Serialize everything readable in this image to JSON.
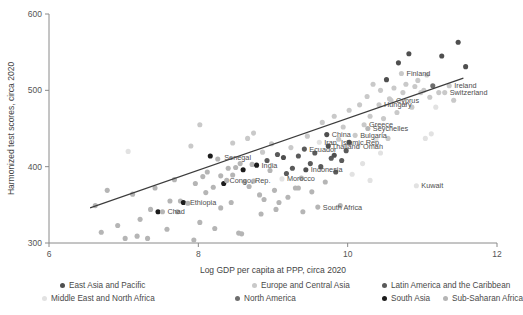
{
  "chart_data": {
    "type": "scatter",
    "title": "",
    "xlabel": "Log GDP per capita at PPP, circa 2020",
    "ylabel": "Harmonized test scores, circa 2020",
    "xlim": [
      6,
      12
    ],
    "ylim": [
      300,
      600
    ],
    "xticks": [
      6,
      8,
      10,
      12
    ],
    "yticks": [
      300,
      400,
      500,
      600
    ],
    "grid": false,
    "legend_position": "bottom",
    "trendline": {
      "x0": 6.55,
      "y0": 346,
      "x1": 11.55,
      "y1": 516,
      "color": "#3c3c3c"
    },
    "legend": [
      {
        "name": "East Asia and Pacific",
        "color": "#4f4f4f"
      },
      {
        "name": "Europe and Central Asia",
        "color": "#c9c9c9"
      },
      {
        "name": "Latin America and the Caribbean",
        "color": "#5a5a5a"
      },
      {
        "name": "Middle East and North Africa",
        "color": "#e2e2e2"
      },
      {
        "name": "North America",
        "color": "#6e6e6e"
      },
      {
        "name": "South Asia",
        "color": "#1c1c1c"
      },
      {
        "name": "Sub-Saharan Africa",
        "color": "#b5b5b5"
      }
    ],
    "annotations": [
      {
        "label": "Finland",
        "x": 10.72,
        "y": 522
      },
      {
        "label": "Ireland",
        "x": 11.36,
        "y": 506
      },
      {
        "label": "Switzerland",
        "x": 11.3,
        "y": 497
      },
      {
        "label": "Cyprus",
        "x": 10.58,
        "y": 487
      },
      {
        "label": "Hungary",
        "x": 10.42,
        "y": 481
      },
      {
        "label": "Greece",
        "x": 10.22,
        "y": 455
      },
      {
        "label": "Seychelles",
        "x": 10.27,
        "y": 450
      },
      {
        "label": "Bulgaria",
        "x": 10.1,
        "y": 441
      },
      {
        "label": "China",
        "x": 9.72,
        "y": 442
      },
      {
        "label": "Iran, Islamic Rep.",
        "x": 9.62,
        "y": 432
      },
      {
        "label": "Thailand",
        "x": 9.72,
        "y": 427
      },
      {
        "label": "Oman",
        "x": 10.14,
        "y": 427
      },
      {
        "label": "Ecuador",
        "x": 9.42,
        "y": 423
      },
      {
        "label": "Senegal",
        "x": 8.28,
        "y": 412
      },
      {
        "label": "India",
        "x": 8.78,
        "y": 402
      },
      {
        "label": "Indonesia",
        "x": 9.44,
        "y": 396
      },
      {
        "label": "Morocco",
        "x": 9.12,
        "y": 384
      },
      {
        "label": "Congo, Rep.",
        "x": 8.35,
        "y": 382
      },
      {
        "label": "Ethiopia",
        "x": 7.82,
        "y": 353
      },
      {
        "label": "Chad",
        "x": 7.52,
        "y": 341
      },
      {
        "label": "South Africa",
        "x": 9.6,
        "y": 347
      },
      {
        "label": "Kuwait",
        "x": 10.92,
        "y": 375
      }
    ],
    "points": [
      {
        "x": 6.62,
        "y": 349,
        "g": 6
      },
      {
        "x": 6.7,
        "y": 314,
        "g": 6
      },
      {
        "x": 6.78,
        "y": 369,
        "g": 6
      },
      {
        "x": 6.92,
        "y": 323,
        "g": 6
      },
      {
        "x": 7.02,
        "y": 306,
        "g": 6
      },
      {
        "x": 7.06,
        "y": 420,
        "g": 3
      },
      {
        "x": 7.12,
        "y": 364,
        "g": 6
      },
      {
        "x": 7.18,
        "y": 309,
        "g": 6
      },
      {
        "x": 7.22,
        "y": 331,
        "g": 6
      },
      {
        "x": 7.32,
        "y": 306,
        "g": 6
      },
      {
        "x": 7.36,
        "y": 344,
        "g": 6
      },
      {
        "x": 7.42,
        "y": 372,
        "g": 6
      },
      {
        "x": 7.46,
        "y": 341,
        "g": 5
      },
      {
        "x": 7.52,
        "y": 341,
        "g": 6
      },
      {
        "x": 7.58,
        "y": 318,
        "g": 6
      },
      {
        "x": 7.62,
        "y": 355,
        "g": 6
      },
      {
        "x": 7.68,
        "y": 383,
        "g": 6
      },
      {
        "x": 7.72,
        "y": 341,
        "g": 6
      },
      {
        "x": 7.76,
        "y": 355,
        "g": 6
      },
      {
        "x": 7.8,
        "y": 353,
        "g": 5
      },
      {
        "x": 7.86,
        "y": 352,
        "g": 6
      },
      {
        "x": 7.9,
        "y": 427,
        "g": 1
      },
      {
        "x": 7.94,
        "y": 304,
        "g": 6
      },
      {
        "x": 7.96,
        "y": 378,
        "g": 6
      },
      {
        "x": 8.02,
        "y": 455,
        "g": 1
      },
      {
        "x": 8.06,
        "y": 387,
        "g": 6
      },
      {
        "x": 8.1,
        "y": 366,
        "g": 6
      },
      {
        "x": 8.12,
        "y": 393,
        "g": 6
      },
      {
        "x": 8.16,
        "y": 414,
        "g": 5
      },
      {
        "x": 8.2,
        "y": 373,
        "g": 6
      },
      {
        "x": 8.22,
        "y": 319,
        "g": 6
      },
      {
        "x": 8.26,
        "y": 410,
        "g": 6
      },
      {
        "x": 8.3,
        "y": 388,
        "g": 6
      },
      {
        "x": 8.34,
        "y": 378,
        "g": 5
      },
      {
        "x": 8.38,
        "y": 382,
        "g": 6
      },
      {
        "x": 8.4,
        "y": 398,
        "g": 6
      },
      {
        "x": 8.44,
        "y": 353,
        "g": 6
      },
      {
        "x": 8.46,
        "y": 389,
        "g": 6
      },
      {
        "x": 8.5,
        "y": 399,
        "g": 6
      },
      {
        "x": 8.54,
        "y": 313,
        "g": 6
      },
      {
        "x": 8.56,
        "y": 404,
        "g": 6
      },
      {
        "x": 8.58,
        "y": 312,
        "g": 6
      },
      {
        "x": 8.6,
        "y": 396,
        "g": 5
      },
      {
        "x": 8.62,
        "y": 380,
        "g": 6
      },
      {
        "x": 8.66,
        "y": 437,
        "g": 1
      },
      {
        "x": 8.68,
        "y": 374,
        "g": 6
      },
      {
        "x": 8.72,
        "y": 403,
        "g": 6
      },
      {
        "x": 8.74,
        "y": 381,
        "g": 6
      },
      {
        "x": 8.78,
        "y": 402,
        "g": 5
      },
      {
        "x": 8.82,
        "y": 363,
        "g": 6
      },
      {
        "x": 8.86,
        "y": 419,
        "g": 1
      },
      {
        "x": 8.88,
        "y": 357,
        "g": 6
      },
      {
        "x": 8.92,
        "y": 408,
        "g": 2
      },
      {
        "x": 8.96,
        "y": 395,
        "g": 6
      },
      {
        "x": 8.98,
        "y": 430,
        "g": 1
      },
      {
        "x": 9.02,
        "y": 369,
        "g": 6
      },
      {
        "x": 9.06,
        "y": 416,
        "g": 2
      },
      {
        "x": 9.08,
        "y": 353,
        "g": 6
      },
      {
        "x": 9.12,
        "y": 384,
        "g": 3
      },
      {
        "x": 9.14,
        "y": 412,
        "g": 0
      },
      {
        "x": 9.18,
        "y": 391,
        "g": 2
      },
      {
        "x": 9.2,
        "y": 360,
        "g": 6
      },
      {
        "x": 9.24,
        "y": 425,
        "g": 1
      },
      {
        "x": 9.26,
        "y": 398,
        "g": 2
      },
      {
        "x": 9.3,
        "y": 372,
        "g": 6
      },
      {
        "x": 9.34,
        "y": 414,
        "g": 2
      },
      {
        "x": 9.38,
        "y": 385,
        "g": 6
      },
      {
        "x": 9.42,
        "y": 423,
        "g": 2
      },
      {
        "x": 9.44,
        "y": 396,
        "g": 0
      },
      {
        "x": 9.46,
        "y": 440,
        "g": 1
      },
      {
        "x": 9.5,
        "y": 404,
        "g": 2
      },
      {
        "x": 9.52,
        "y": 367,
        "g": 6
      },
      {
        "x": 9.56,
        "y": 418,
        "g": 2
      },
      {
        "x": 9.6,
        "y": 347,
        "g": 6
      },
      {
        "x": 9.62,
        "y": 432,
        "g": 3
      },
      {
        "x": 9.64,
        "y": 400,
        "g": 2
      },
      {
        "x": 9.66,
        "y": 458,
        "g": 1
      },
      {
        "x": 9.7,
        "y": 380,
        "g": 6
      },
      {
        "x": 9.72,
        "y": 442,
        "g": 0
      },
      {
        "x": 9.74,
        "y": 427,
        "g": 0
      },
      {
        "x": 9.78,
        "y": 411,
        "g": 2
      },
      {
        "x": 9.82,
        "y": 466,
        "g": 1
      },
      {
        "x": 9.84,
        "y": 393,
        "g": 2
      },
      {
        "x": 9.88,
        "y": 436,
        "g": 1
      },
      {
        "x": 9.92,
        "y": 408,
        "g": 2
      },
      {
        "x": 9.94,
        "y": 452,
        "g": 1
      },
      {
        "x": 9.98,
        "y": 421,
        "g": 2
      },
      {
        "x": 10.02,
        "y": 474,
        "g": 1
      },
      {
        "x": 10.06,
        "y": 390,
        "g": 3
      },
      {
        "x": 10.1,
        "y": 441,
        "g": 1
      },
      {
        "x": 10.14,
        "y": 427,
        "g": 3
      },
      {
        "x": 10.16,
        "y": 481,
        "g": 1
      },
      {
        "x": 10.2,
        "y": 404,
        "g": 3
      },
      {
        "x": 10.22,
        "y": 455,
        "g": 1
      },
      {
        "x": 10.26,
        "y": 492,
        "g": 1
      },
      {
        "x": 10.27,
        "y": 450,
        "g": 6
      },
      {
        "x": 10.3,
        "y": 466,
        "g": 1
      },
      {
        "x": 10.34,
        "y": 508,
        "g": 1
      },
      {
        "x": 10.38,
        "y": 436,
        "g": 3
      },
      {
        "x": 10.42,
        "y": 481,
        "g": 1
      },
      {
        "x": 10.44,
        "y": 500,
        "g": 1
      },
      {
        "x": 10.48,
        "y": 463,
        "g": 1
      },
      {
        "x": 10.52,
        "y": 514,
        "g": 0
      },
      {
        "x": 10.56,
        "y": 489,
        "g": 1
      },
      {
        "x": 10.58,
        "y": 487,
        "g": 1
      },
      {
        "x": 10.62,
        "y": 503,
        "g": 1
      },
      {
        "x": 10.66,
        "y": 471,
        "g": 1
      },
      {
        "x": 10.68,
        "y": 536,
        "g": 0
      },
      {
        "x": 10.72,
        "y": 522,
        "g": 1
      },
      {
        "x": 10.74,
        "y": 497,
        "g": 1
      },
      {
        "x": 10.78,
        "y": 508,
        "g": 1
      },
      {
        "x": 10.82,
        "y": 548,
        "g": 0
      },
      {
        "x": 10.86,
        "y": 478,
        "g": 1
      },
      {
        "x": 10.9,
        "y": 505,
        "g": 1
      },
      {
        "x": 10.92,
        "y": 375,
        "g": 3
      },
      {
        "x": 10.94,
        "y": 513,
        "g": 1
      },
      {
        "x": 10.98,
        "y": 497,
        "g": 1
      },
      {
        "x": 11.02,
        "y": 500,
        "g": 1
      },
      {
        "x": 11.04,
        "y": 437,
        "g": 3
      },
      {
        "x": 11.06,
        "y": 520,
        "g": 1
      },
      {
        "x": 11.1,
        "y": 491,
        "g": 1
      },
      {
        "x": 11.14,
        "y": 506,
        "g": 4
      },
      {
        "x": 11.18,
        "y": 478,
        "g": 3
      },
      {
        "x": 11.22,
        "y": 497,
        "g": 1
      },
      {
        "x": 11.26,
        "y": 545,
        "g": 0
      },
      {
        "x": 11.3,
        "y": 497,
        "g": 1
      },
      {
        "x": 11.36,
        "y": 506,
        "g": 1
      },
      {
        "x": 11.42,
        "y": 487,
        "g": 1
      },
      {
        "x": 11.48,
        "y": 563,
        "g": 0
      },
      {
        "x": 11.58,
        "y": 531,
        "g": 0
      },
      {
        "x": 11.12,
        "y": 443,
        "g": 3
      },
      {
        "x": 10.44,
        "y": 418,
        "g": 3
      },
      {
        "x": 10.54,
        "y": 437,
        "g": 1
      },
      {
        "x": 9.9,
        "y": 349,
        "g": 6
      },
      {
        "x": 9.4,
        "y": 341,
        "g": 6
      },
      {
        "x": 9.04,
        "y": 344,
        "g": 6
      },
      {
        "x": 8.84,
        "y": 338,
        "g": 6
      },
      {
        "x": 8.3,
        "y": 346,
        "g": 6
      },
      {
        "x": 8.02,
        "y": 327,
        "g": 6
      },
      {
        "x": 9.82,
        "y": 415,
        "g": 0
      },
      {
        "x": 10.02,
        "y": 432,
        "g": 0
      },
      {
        "x": 9.34,
        "y": 372,
        "g": 6
      },
      {
        "x": 10.3,
        "y": 382,
        "g": 3
      },
      {
        "x": 8.46,
        "y": 431,
        "g": 1
      },
      {
        "x": 8.74,
        "y": 444,
        "g": 1
      }
    ]
  },
  "legend": {
    "items": [
      {
        "label": "East Asia and Pacific",
        "color": "#4f4f4f"
      },
      {
        "label": "Europe and Central Asia",
        "color": "#c9c9c9"
      },
      {
        "label": "Latin America and the Caribbean",
        "color": "#5a5a5a"
      },
      {
        "label": "Middle East and North Africa",
        "color": "#e2e2e2"
      },
      {
        "label": "North America",
        "color": "#6e6e6e"
      },
      {
        "label": "South Asia",
        "color": "#1c1c1c"
      },
      {
        "label": "Sub-Saharan Africa",
        "color": "#b5b5b5"
      }
    ]
  }
}
